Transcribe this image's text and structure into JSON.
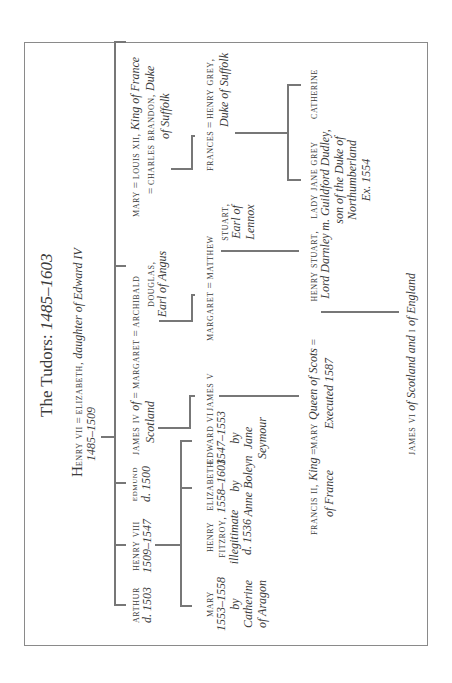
{
  "title": {
    "prefix": "The Tudors: ",
    "years": "1485–1603"
  },
  "root": {
    "name_initial": "H",
    "name_rest": "enry vii",
    "eq": " = ",
    "spouse": "elizabeth,",
    "spouse_note": " daughter of Edward IV",
    "years": "1485–1509"
  },
  "gen1": {
    "arthur": {
      "name": "arthur",
      "note": "d. 1503"
    },
    "henry8": {
      "name": "henry viii",
      "note": "1509–1547"
    },
    "edmund": {
      "name": "edmund",
      "note": "d. 1500"
    },
    "james4": {
      "name": "james iv",
      "note_a": " of",
      "eq": " = ",
      "note_b": "Scotland"
    },
    "margaret": {
      "name": "margaret",
      "eq": " = ",
      "spouse": "archibald",
      "spouse2": "douglas,",
      "spouse_note": "Earl of Angus"
    },
    "mary": {
      "name": "mary",
      "eq": " = ",
      "spouse1": "louis xii,",
      "spouse1_note": " King of France",
      "eq2": "= ",
      "spouse2": "charles brandon,",
      "spouse2_note": " Duke",
      "spouse2_note2": "of Suffolk"
    }
  },
  "gen2": {
    "mary1": {
      "name": "mary",
      "years": "1553–1558",
      "by": "by",
      "mother": "Catherine",
      "mother2": "of Aragon"
    },
    "fitzroy": {
      "name": "henry",
      "name2": "fitzroy,",
      "note": "illegitimate",
      "died": "d. 1536"
    },
    "elizabeth": {
      "name": "elizabeth",
      "years": "1558–1603",
      "by": "by",
      "mother": "Anne Boleyn"
    },
    "edward6": {
      "name": "edward vi",
      "years": "1547–1553",
      "by": "by",
      "mother": "Jane",
      "mother2": "Seymour"
    },
    "james5": {
      "name": "james v"
    },
    "margaret_d": {
      "name": "margaret",
      "eq": " = ",
      "spouse": "matthew",
      "spouse2": "stuart,",
      "spouse_note": "Earl of",
      "spouse_note2": "Lennox"
    },
    "frances": {
      "name": "frances",
      "eq": " = ",
      "spouse": "henry grey,",
      "spouse_note": "Duke of Suffolk"
    }
  },
  "gen3": {
    "francis2": {
      "name": "francis ii,",
      "note": " King",
      "eq": " = ",
      "note2": "of France"
    },
    "maryqos": {
      "name": "mary",
      "note": " Queen of Scots",
      "eq": " = ",
      "note2": "Executed 1587"
    },
    "darnley": {
      "name": "henry stuart,",
      "note": "Lord Darnley"
    },
    "janegrey": {
      "name": "lady jane grey",
      "note1": "m. Guildford Dudley,",
      "note2": "son of the Duke of",
      "note3": "Northumberland",
      "note4": "Ex. 1554"
    },
    "catherine": {
      "name": "catherine"
    }
  },
  "gen4": {
    "james6": {
      "name": "james vi",
      "note_a": " of Scotland and ",
      "roman": "i",
      "note_b": " of England"
    }
  }
}
